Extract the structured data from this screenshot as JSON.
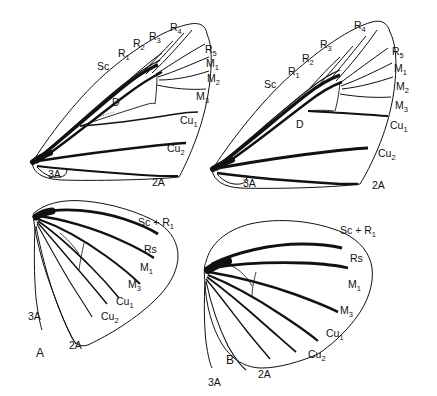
{
  "figure": {
    "kind": "scientific-line-drawing",
    "background_color": "#ffffff",
    "ink_color": "#111111",
    "panels": [
      {
        "id": "forewing-top-left",
        "type": "forewing",
        "panel_label": "",
        "labels": [
          {
            "name": "Sc",
            "base": "Sc",
            "sub": ""
          },
          {
            "name": "R1",
            "base": "R",
            "sub": "1"
          },
          {
            "name": "R2",
            "base": "R",
            "sub": "2"
          },
          {
            "name": "R3",
            "base": "R",
            "sub": "3"
          },
          {
            "name": "R4",
            "base": "R",
            "sub": "4"
          },
          {
            "name": "R5",
            "base": "R",
            "sub": "5"
          },
          {
            "name": "M1",
            "base": "M",
            "sub": "1"
          },
          {
            "name": "M2",
            "base": "M",
            "sub": "2"
          },
          {
            "name": "M3",
            "base": "M",
            "sub": "3"
          },
          {
            "name": "Cu1",
            "base": "Cu",
            "sub": "1"
          },
          {
            "name": "Cu2",
            "base": "Cu",
            "sub": "2"
          },
          {
            "name": "2A",
            "base": "2A",
            "sub": ""
          },
          {
            "name": "3A",
            "base": "3A",
            "sub": ""
          },
          {
            "name": "D",
            "base": "D",
            "sub": ""
          }
        ]
      },
      {
        "id": "forewing-top-right",
        "type": "forewing",
        "panel_label": "",
        "labels": [
          {
            "name": "Sc",
            "base": "Sc",
            "sub": ""
          },
          {
            "name": "R1",
            "base": "R",
            "sub": "1"
          },
          {
            "name": "R2",
            "base": "R",
            "sub": "2"
          },
          {
            "name": "R3",
            "base": "R",
            "sub": "3"
          },
          {
            "name": "R4",
            "base": "R",
            "sub": "4"
          },
          {
            "name": "R5",
            "base": "R",
            "sub": "5"
          },
          {
            "name": "M1",
            "base": "M",
            "sub": "1"
          },
          {
            "name": "M2",
            "base": "M",
            "sub": "2"
          },
          {
            "name": "M3",
            "base": "M",
            "sub": "3"
          },
          {
            "name": "Cu1",
            "base": "Cu",
            "sub": "1"
          },
          {
            "name": "Cu2",
            "base": "Cu",
            "sub": "2"
          },
          {
            "name": "2A",
            "base": "2A",
            "sub": ""
          },
          {
            "name": "3A",
            "base": "3A",
            "sub": ""
          },
          {
            "name": "D",
            "base": "D",
            "sub": ""
          }
        ]
      },
      {
        "id": "hindwing-bottom-left",
        "type": "hindwing",
        "panel_label": "A",
        "labels": [
          {
            "name": "ScR1",
            "base": "Sc + R",
            "sub": "1"
          },
          {
            "name": "Rs",
            "base": "Rs",
            "sub": ""
          },
          {
            "name": "M1",
            "base": "M",
            "sub": "1"
          },
          {
            "name": "M3",
            "base": "M",
            "sub": "3"
          },
          {
            "name": "Cu1",
            "base": "Cu",
            "sub": "1"
          },
          {
            "name": "Cu2",
            "base": "Cu",
            "sub": "2"
          },
          {
            "name": "2A",
            "base": "2A",
            "sub": ""
          },
          {
            "name": "3A",
            "base": "3A",
            "sub": ""
          }
        ]
      },
      {
        "id": "hindwing-bottom-right",
        "type": "hindwing",
        "panel_label": "B",
        "labels": [
          {
            "name": "ScR1",
            "base": "Sc + R",
            "sub": "1"
          },
          {
            "name": "Rs",
            "base": "Rs",
            "sub": ""
          },
          {
            "name": "M1",
            "base": "M",
            "sub": "1"
          },
          {
            "name": "M3",
            "base": "M",
            "sub": "3"
          },
          {
            "name": "Cu1",
            "base": "Cu",
            "sub": "1"
          },
          {
            "name": "Cu2",
            "base": "Cu",
            "sub": "2"
          },
          {
            "name": "2A",
            "base": "2A",
            "sub": ""
          },
          {
            "name": "3A",
            "base": "3A",
            "sub": ""
          }
        ]
      }
    ],
    "text": {
      "Sc": "Sc",
      "R": "R",
      "M": "M",
      "Cu": "Cu",
      "Rs": "Rs",
      "ScR1_base": "Sc + R",
      "A2": "2A",
      "A3": "3A",
      "D": "D",
      "panel_a": "A",
      "panel_b": "B",
      "s1": "1",
      "s2": "2",
      "s3": "3",
      "s4": "4",
      "s5": "5"
    }
  }
}
